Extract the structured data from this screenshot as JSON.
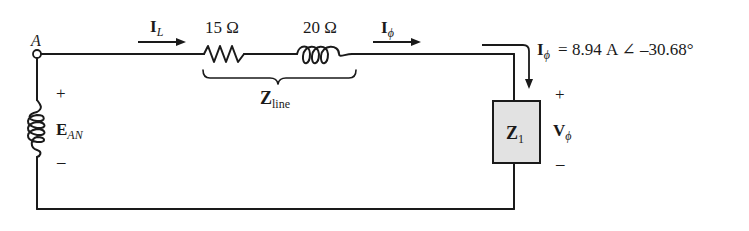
{
  "diagram": {
    "type": "single-phase equivalent circuit",
    "node": {
      "label": "A"
    },
    "source": {
      "symbol": "E",
      "subscript": "AN",
      "plus": "+",
      "minus": "–"
    },
    "line_current": {
      "symbol": "I",
      "subscript": "L"
    },
    "resistor": {
      "value": "15 Ω"
    },
    "inductor": {
      "value": "20 Ω"
    },
    "line_impedance": {
      "symbol": "Z",
      "subscript": "line"
    },
    "phase_current": {
      "symbol": "I",
      "subscript": "ϕ"
    },
    "phase_current_value": {
      "symbol": "I",
      "subscript": "ϕ",
      "text": "=  8.94 A ∠ –30.68°"
    },
    "load": {
      "symbol": "Z",
      "subscript": "1"
    },
    "load_voltage": {
      "symbol": "V",
      "subscript": "ϕ",
      "plus": "+",
      "minus": "–"
    },
    "colors": {
      "wire": "#1a1a1a",
      "load_fill": "#e2e2e2"
    }
  }
}
